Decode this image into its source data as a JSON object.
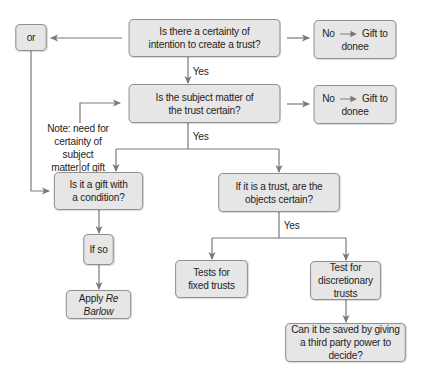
{
  "diagram": {
    "nodes": {
      "or": {
        "label": "or"
      },
      "certainty_intention": {
        "line1": "Is there a certainty of",
        "line2": "intention to create a trust?"
      },
      "no_gift_1": {
        "no": "No",
        "line1": "Gift to",
        "line2": "donee"
      },
      "subject_matter": {
        "line1": "Is the subject matter of",
        "line2": "the trust certain?"
      },
      "no_gift_2": {
        "no": "No",
        "line1": "Gift to",
        "line2": "donee"
      },
      "gift_condition": {
        "line1": "Is it a gift with",
        "line2": "a condition?"
      },
      "objects_certain": {
        "line1": "If it is a trust, are the",
        "line2": "objects certain?"
      },
      "if_so": {
        "label": "If so"
      },
      "apply_re_barlow": {
        "prefix": "Apply",
        "case": "Re Barlow"
      },
      "fixed_trusts": {
        "line1": "Tests for",
        "line2": "fixed trusts"
      },
      "discretionary_trusts": {
        "line1": "Test for",
        "line2": "discretionary trusts"
      },
      "third_party": {
        "line1": "Can it be saved by giving",
        "line2": "a third party power to decide?"
      }
    },
    "edge_labels": {
      "yes_1": "Yes",
      "yes_2": "Yes",
      "yes_3": "Yes"
    },
    "note": {
      "line1": "Note: need for",
      "line2": "certainty of subject",
      "line3": "matter of gift"
    },
    "colors": {
      "box_fill": "#e6e6e6",
      "box_border": "#8c8c8c",
      "connector": "#7a7a7a",
      "text": "#1e1e1e"
    }
  }
}
